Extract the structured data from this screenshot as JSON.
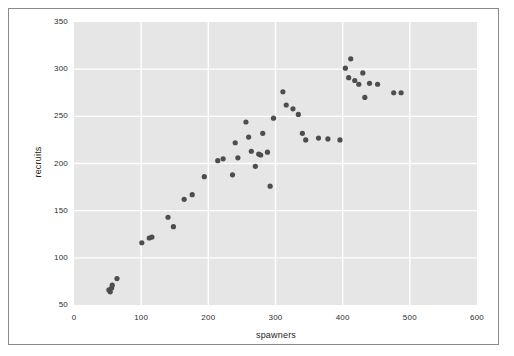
{
  "figure": {
    "background_color": "#ffffff",
    "frame_border_color": "#8a8a8a",
    "plot_background_color": "#e6e6e6",
    "gridline_color": "#ffffff",
    "marker_color": "#4d4d4d",
    "axis_text_color": "#2b2b2b"
  },
  "chart_data": {
    "type": "scatter",
    "title": "",
    "xlabel": "spawners",
    "ylabel": "recruits",
    "xlim": [
      0,
      600
    ],
    "ylim": [
      50,
      350
    ],
    "xticks": [
      0,
      100,
      200,
      300,
      400,
      500,
      600
    ],
    "yticks": [
      50,
      100,
      150,
      200,
      250,
      300,
      350
    ],
    "xtick_labels": [
      "0",
      "100",
      "200",
      "300",
      "400",
      "500",
      "600"
    ],
    "ytick_labels": [
      "50",
      "100",
      "150",
      "200",
      "250",
      "300",
      "350"
    ],
    "grid": true,
    "legend": null,
    "marker_size": 4,
    "points": [
      {
        "x": 52,
        "y": 66
      },
      {
        "x": 54,
        "y": 64
      },
      {
        "x": 56,
        "y": 68
      },
      {
        "x": 57,
        "y": 71
      },
      {
        "x": 64,
        "y": 78
      },
      {
        "x": 101,
        "y": 116
      },
      {
        "x": 112,
        "y": 121
      },
      {
        "x": 116,
        "y": 122
      },
      {
        "x": 140,
        "y": 143
      },
      {
        "x": 148,
        "y": 133
      },
      {
        "x": 164,
        "y": 162
      },
      {
        "x": 176,
        "y": 167
      },
      {
        "x": 194,
        "y": 186
      },
      {
        "x": 214,
        "y": 203
      },
      {
        "x": 222,
        "y": 205
      },
      {
        "x": 236,
        "y": 188
      },
      {
        "x": 240,
        "y": 222
      },
      {
        "x": 244,
        "y": 206
      },
      {
        "x": 256,
        "y": 244
      },
      {
        "x": 260,
        "y": 228
      },
      {
        "x": 264,
        "y": 213
      },
      {
        "x": 270,
        "y": 197
      },
      {
        "x": 275,
        "y": 210
      },
      {
        "x": 278,
        "y": 209
      },
      {
        "x": 281,
        "y": 232
      },
      {
        "x": 288,
        "y": 212
      },
      {
        "x": 292,
        "y": 176
      },
      {
        "x": 297,
        "y": 248
      },
      {
        "x": 311,
        "y": 276
      },
      {
        "x": 316,
        "y": 262
      },
      {
        "x": 326,
        "y": 258
      },
      {
        "x": 334,
        "y": 252
      },
      {
        "x": 340,
        "y": 232
      },
      {
        "x": 345,
        "y": 225
      },
      {
        "x": 364,
        "y": 227
      },
      {
        "x": 378,
        "y": 226
      },
      {
        "x": 396,
        "y": 225
      },
      {
        "x": 404,
        "y": 301
      },
      {
        "x": 409,
        "y": 291
      },
      {
        "x": 412,
        "y": 311
      },
      {
        "x": 418,
        "y": 288
      },
      {
        "x": 424,
        "y": 284
      },
      {
        "x": 430,
        "y": 296
      },
      {
        "x": 433,
        "y": 270
      },
      {
        "x": 440,
        "y": 285
      },
      {
        "x": 452,
        "y": 284
      },
      {
        "x": 476,
        "y": 275
      },
      {
        "x": 487,
        "y": 275
      }
    ]
  }
}
